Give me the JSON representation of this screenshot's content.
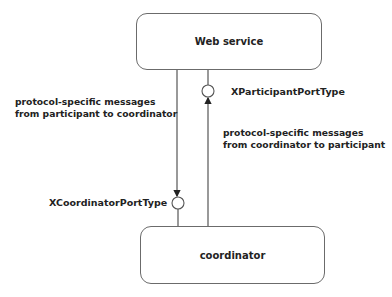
{
  "diagram": {
    "nodes": [
      {
        "id": "web-service",
        "label": "Web service"
      },
      {
        "id": "coordinator",
        "label": "coordinator"
      }
    ],
    "ports": [
      {
        "id": "x-participant-port",
        "label": "XParticipantPortType",
        "owner": "web-service"
      },
      {
        "id": "x-coordinator-port",
        "label": "XCoordinatorPortType",
        "owner": "coordinator"
      }
    ],
    "edges": [
      {
        "from": "web-service",
        "to": "coordinator",
        "direction": "down",
        "label_line1": "protocol-specific messages",
        "label_line2": "from participant to coordinator"
      },
      {
        "from": "coordinator",
        "to": "web-service",
        "direction": "up",
        "label_line1": "protocol-specific messages",
        "label_line2": "from coordinator to participant"
      }
    ]
  },
  "colors": {
    "stroke": "#6b6b6b",
    "text": "#222222",
    "background": "#ffffff"
  }
}
